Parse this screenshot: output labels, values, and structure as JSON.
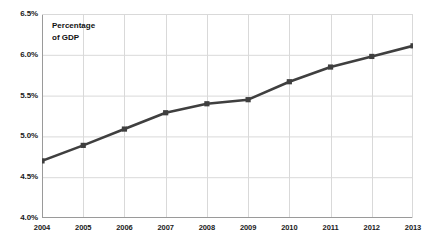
{
  "chart_data": {
    "type": "line",
    "title": "",
    "subtitle": "",
    "xlabel": "",
    "ylabel": "",
    "annotation": "Percentage\nof GDP",
    "categories": [
      "2004",
      "2005",
      "2006",
      "2007",
      "2008",
      "2009",
      "2010",
      "2011",
      "2012",
      "2013"
    ],
    "x": [
      2004,
      2005,
      2006,
      2007,
      2008,
      2009,
      2010,
      2011,
      2012,
      2013
    ],
    "values": [
      4.7,
      4.89,
      5.09,
      5.29,
      5.4,
      5.45,
      5.67,
      5.85,
      5.98,
      6.11
    ],
    "series": [
      {
        "name": "Percentage of GDP",
        "values": [
          4.7,
          4.89,
          5.09,
          5.29,
          5.4,
          5.45,
          5.67,
          5.85,
          5.98,
          6.11
        ]
      }
    ],
    "ylim": [
      4.0,
      6.5
    ],
    "ytick_values": [
      4.0,
      4.5,
      5.0,
      5.5,
      6.0,
      6.5
    ],
    "ytick_labels": [
      "4.0%",
      "4.5%",
      "5.0%",
      "5.5%",
      "6.0%",
      "6.5%"
    ],
    "xtick_labels": [
      "2004",
      "2005",
      "2006",
      "2007",
      "2008",
      "2009",
      "2010",
      "2011",
      "2012",
      "2013"
    ],
    "grid": true,
    "grid_axis": "both",
    "legend": false,
    "legend_position": "none",
    "marker": "square",
    "colors": {
      "line": "#3f3f3f",
      "marker": "#3f3f3f",
      "grid": "#d9d9d9",
      "axis": "#bfbfbf",
      "text": "#1a1a1a",
      "background": "#ffffff"
    }
  }
}
